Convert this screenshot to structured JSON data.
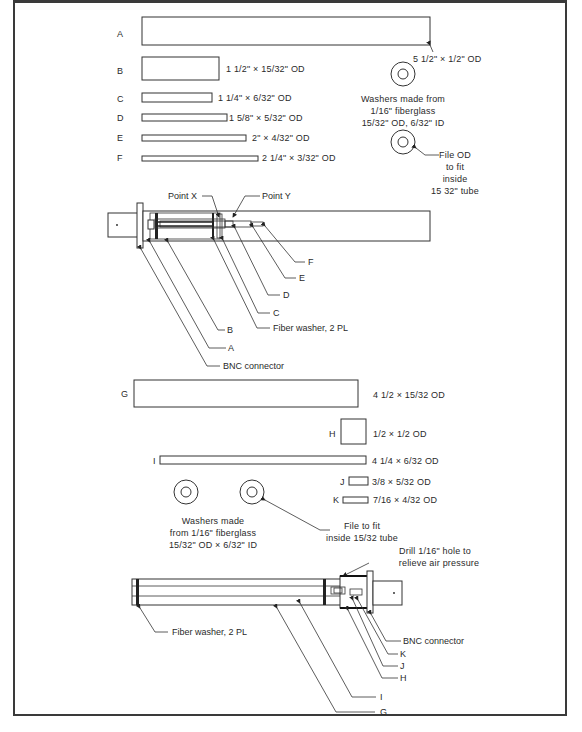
{
  "figure": {
    "top_section": {
      "parts": [
        {
          "id": "A",
          "dimension": "5 1/2\" × 1/2\" OD"
        },
        {
          "id": "B",
          "dimension": "1 1/2\" × 15/32\" OD"
        },
        {
          "id": "C",
          "dimension": "1 1/4\" × 6/32\" OD"
        },
        {
          "id": "D",
          "dimension": "1 5/8\" × 5/32\" OD"
        },
        {
          "id": "E",
          "dimension": "2\" × 4/32\" OD"
        },
        {
          "id": "F",
          "dimension": "2 1/4\" × 3/32\" OD"
        }
      ],
      "washer_note": [
        "Washers made from",
        "1/16\" fiberglass",
        "15/32\" OD, 6/32\" ID"
      ],
      "file_note": [
        "File OD",
        "to fit",
        "inside",
        "15 32\" tube"
      ],
      "assembly": {
        "point_x": "Point X",
        "point_y": "Point Y",
        "callouts": [
          "F",
          "E",
          "D",
          "C",
          "Fiber washer, 2 PL",
          "B",
          "A",
          "BNC connector"
        ]
      }
    },
    "bottom_section": {
      "parts": [
        {
          "id": "G",
          "dimension": "4 1/2 × 15/32 OD"
        },
        {
          "id": "H",
          "dimension": "1/2 × 1/2 OD"
        },
        {
          "id": "I",
          "dimension": "4 1/4 × 6/32 OD"
        },
        {
          "id": "J",
          "dimension": "3/8 × 5/32 OD"
        },
        {
          "id": "K",
          "dimension": "7/16 × 4/32 OD"
        }
      ],
      "washer_note": [
        "Washers made",
        "from 1/16\" fiberglass",
        "15/32\" OD × 6/32\" ID"
      ],
      "file_note": [
        "File to fit",
        "inside 15/32 tube"
      ],
      "drill_note": [
        "Drill 1/16\" hole to",
        "relieve air pressure"
      ],
      "assembly": {
        "callouts": [
          "BNC connector",
          "K",
          "J",
          "H",
          "I",
          "G",
          "Fiber washer, 2 PL"
        ]
      }
    },
    "caption": ""
  }
}
